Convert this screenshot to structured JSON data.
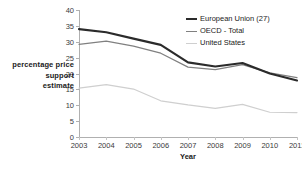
{
  "chart_data": {
    "type": "line",
    "title": "",
    "xlabel": "Year",
    "ylabel": "percentage price support estimate",
    "ylabel_lines": [
      "percentage price",
      "support",
      "estimate"
    ],
    "x": [
      2003,
      2004,
      2005,
      2006,
      2007,
      2008,
      2009,
      2010,
      2011
    ],
    "categories": [
      "2003",
      "2004",
      "2005",
      "2006",
      "2007",
      "2008",
      "2009",
      "2010",
      "2011"
    ],
    "xlim": [
      2003,
      2011
    ],
    "ylim": [
      0,
      40
    ],
    "yticks": [
      0,
      5,
      10,
      15,
      20,
      25,
      30,
      35,
      40
    ],
    "ytick_labels": [
      "0",
      "5",
      "10",
      "15",
      "20",
      "25",
      "30",
      "35",
      "40"
    ],
    "grid": false,
    "legend_position": "top-right",
    "series": [
      {
        "name": "European Union (27)",
        "color": "#2b2b2b",
        "width": 2.2,
        "values": [
          34.0,
          33.0,
          31.0,
          29.0,
          23.5,
          22.2,
          23.3,
          20.0,
          17.8
        ]
      },
      {
        "name": "OECD - Total",
        "color": "#808080",
        "width": 1.2,
        "values": [
          29.2,
          30.2,
          28.6,
          26.4,
          22.0,
          21.2,
          22.8,
          20.2,
          18.7
        ]
      },
      {
        "name": "United States",
        "color": "#cfcfcf",
        "width": 1.2,
        "values": [
          15.4,
          16.5,
          15.1,
          11.4,
          10.1,
          9.0,
          10.3,
          7.8,
          7.7
        ]
      }
    ]
  }
}
